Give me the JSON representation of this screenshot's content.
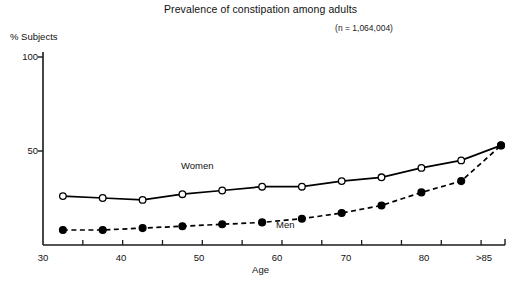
{
  "chart_data": {
    "type": "line",
    "title": "Prevalence of constipation among adults",
    "subtitle": "(n = 1,064,004)",
    "xlabel": "Age",
    "ylabel": "% Subjects",
    "ylim": [
      0,
      100
    ],
    "yticks": [
      "100",
      "50"
    ],
    "xticks": [
      "30",
      "40",
      "50",
      "60",
      "70",
      "80",
      ">85"
    ],
    "xtick_values": [
      30,
      40,
      50,
      60,
      70,
      80,
      87.5
    ],
    "xlim": [
      30,
      88
    ],
    "grid": false,
    "legend_position": "inline-annotation",
    "x": [
      32.5,
      37.5,
      42.5,
      47.5,
      52.5,
      57.5,
      62.5,
      67.5,
      72.5,
      77.5,
      82.5,
      87.5
    ],
    "series": [
      {
        "name": "Women",
        "marker": "open-circle",
        "linestyle": "solid",
        "values": [
          26,
          25,
          24,
          27,
          29,
          31,
          31,
          34,
          36,
          41,
          45,
          53
        ]
      },
      {
        "name": "Men",
        "marker": "filled-circle",
        "linestyle": "dashed",
        "values": [
          8,
          8,
          9,
          10,
          11,
          12,
          14,
          17,
          21,
          28,
          34,
          53
        ]
      }
    ],
    "annotations": [
      {
        "text": "Women",
        "x": 52.5,
        "y": 45
      },
      {
        "text": "Men",
        "x": 68.5,
        "y": 7
      }
    ],
    "colors": {
      "line": "#000000",
      "marker_fill_open": "#ffffff",
      "marker_fill_solid": "#000000",
      "axis": "#1a1a1a"
    }
  }
}
